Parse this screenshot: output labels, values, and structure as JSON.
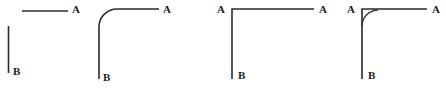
{
  "figure": {
    "width": 446,
    "height": 97,
    "background_color": "#ffffff",
    "stroke_color": "#2a2a2a",
    "label_color": "#1b1b1b"
  },
  "panels": [
    {
      "id": "panel-1",
      "name": "disconnected-segments",
      "label_a": "A",
      "label_b": "B",
      "label_a_x": 72,
      "label_a_y": 4,
      "label_b_x": 13,
      "label_b_y": 66,
      "paths": [
        {
          "name": "horizontal-segment",
          "d": "M 22 11 L 68 11"
        },
        {
          "name": "vertical-segment",
          "d": "M 8.5 26 L 8.5 73"
        }
      ],
      "arcs": []
    },
    {
      "id": "panel-2",
      "name": "large-radius-rounded-corner",
      "label_a": "A",
      "label_b": "B",
      "label_a_x": 163,
      "label_a_y": 4,
      "label_b_x": 103,
      "label_b_y": 72,
      "paths": [
        {
          "name": "rounded-corner-path",
          "d": "M 99 79 L 99 26 A 18 18 0 0 1 117 9 L 159 9"
        }
      ],
      "arcs": []
    },
    {
      "id": "panel-3",
      "name": "sharp-right-angle",
      "label_a_left": "A",
      "label_a_right": "A",
      "label_b": "B",
      "label_a_left_x": 217,
      "label_a_left_y": 4,
      "label_a_right_x": 319,
      "label_a_right_y": 4,
      "label_b_x": 238,
      "label_b_y": 70,
      "paths": [
        {
          "name": "right-angle-path",
          "d": "M 232 79 L 232 9 L 314 9"
        }
      ],
      "arcs": []
    },
    {
      "id": "panel-4",
      "name": "sharp-angle-with-fillet",
      "label_a_left": "A",
      "label_a_right": "A",
      "label_b": "B",
      "label_a_left_x": 347,
      "label_a_left_y": 4,
      "label_a_right_x": 432,
      "label_a_right_y": 4,
      "label_b_x": 368,
      "label_b_y": 70,
      "paths": [
        {
          "name": "right-angle-path",
          "d": "M 362 79 L 362 9 L 427 9"
        }
      ],
      "arcs": [
        {
          "name": "corner-fillet-arc",
          "d": "M 362 26 A 16 16 0 0 1 378 10"
        }
      ]
    }
  ]
}
